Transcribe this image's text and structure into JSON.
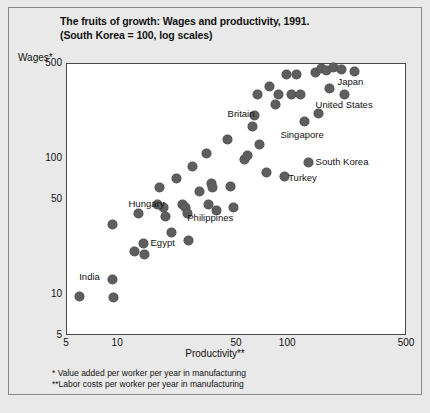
{
  "chart_data": {
    "type": "scatter",
    "title": "The fruits of growth: Wages and productivity, 1991.",
    "subtitle": "(South Korea = 100, log scales)",
    "xlabel": "Productivity**",
    "ylabel": "Wages*",
    "xscale": "log",
    "yscale": "log",
    "xlim": [
      5,
      500
    ],
    "ylim": [
      5,
      500
    ],
    "grid": false,
    "legend": "none",
    "xticks": [
      "5",
      "10",
      "50",
      "100",
      "500"
    ],
    "yticks": [
      "500",
      "100",
      "50",
      "10",
      "5"
    ],
    "footnotes": [
      "* Value added per worker per year in manufacturing",
      "**Labor costs per worker per year in manufacturing"
    ],
    "points": [
      {
        "x": 5.9,
        "y": 9.8
      },
      {
        "x": 9.2,
        "y": 33
      },
      {
        "x": 9.3,
        "y": 13
      },
      {
        "x": 9.4,
        "y": 9.6
      },
      {
        "x": 12.5,
        "y": 21
      },
      {
        "x": 13.2,
        "y": 40
      },
      {
        "x": 14.0,
        "y": 24
      },
      {
        "x": 14.2,
        "y": 20
      },
      {
        "x": 17.0,
        "y": 46
      },
      {
        "x": 17.5,
        "y": 62
      },
      {
        "x": 18.5,
        "y": 44
      },
      {
        "x": 19.0,
        "y": 38
      },
      {
        "x": 20.5,
        "y": 29
      },
      {
        "x": 22.0,
        "y": 72
      },
      {
        "x": 24.0,
        "y": 46
      },
      {
        "x": 25.0,
        "y": 44
      },
      {
        "x": 25.5,
        "y": 40
      },
      {
        "x": 26.0,
        "y": 25
      },
      {
        "x": 27.5,
        "y": 88
      },
      {
        "x": 30.0,
        "y": 58
      },
      {
        "x": 33.0,
        "y": 110
      },
      {
        "x": 34.0,
        "y": 46
      },
      {
        "x": 35.5,
        "y": 66
      },
      {
        "x": 36.0,
        "y": 62
      },
      {
        "x": 38.0,
        "y": 42
      },
      {
        "x": 44.0,
        "y": 140
      },
      {
        "x": 46.0,
        "y": 63
      },
      {
        "x": 48.0,
        "y": 44
      },
      {
        "x": 55.0,
        "y": 100
      },
      {
        "x": 58.0,
        "y": 106
      },
      {
        "x": 62.0,
        "y": 175
      },
      {
        "x": 63.0,
        "y": 210
      },
      {
        "x": 66.0,
        "y": 300
      },
      {
        "x": 68.0,
        "y": 128
      },
      {
        "x": 75.0,
        "y": 80
      },
      {
        "x": 78.0,
        "y": 340
      },
      {
        "x": 84.0,
        "y": 250
      },
      {
        "x": 88.0,
        "y": 300
      },
      {
        "x": 95.0,
        "y": 75
      },
      {
        "x": 98.0,
        "y": 420
      },
      {
        "x": 105.0,
        "y": 300
      },
      {
        "x": 112.0,
        "y": 420
      },
      {
        "x": 118.0,
        "y": 300
      },
      {
        "x": 125.0,
        "y": 190
      },
      {
        "x": 132.0,
        "y": 95
      },
      {
        "x": 145.0,
        "y": 430
      },
      {
        "x": 150.0,
        "y": 215
      },
      {
        "x": 158.0,
        "y": 460
      },
      {
        "x": 168.0,
        "y": 450
      },
      {
        "x": 175.0,
        "y": 330
      },
      {
        "x": 185.0,
        "y": 470
      },
      {
        "x": 205.0,
        "y": 455
      },
      {
        "x": 215.0,
        "y": 300
      },
      {
        "x": 245.0,
        "y": 440
      }
    ],
    "annotations": [
      {
        "label": "India",
        "x": 5.9,
        "y": 13.5,
        "anchor": "left"
      },
      {
        "label": "Egypt",
        "x": 15.5,
        "y": 24,
        "anchor": "left"
      },
      {
        "label": "Hungary",
        "x": 11.5,
        "y": 47,
        "anchor": "left"
      },
      {
        "label": "Philippines",
        "x": 25.5,
        "y": 37,
        "anchor": "left"
      },
      {
        "label": "Turkey",
        "x": 100,
        "y": 72,
        "anchor": "left"
      },
      {
        "label": "South Korea",
        "x": 145,
        "y": 95,
        "anchor": "left"
      },
      {
        "label": "Singapore",
        "x": 90,
        "y": 150,
        "anchor": "left"
      },
      {
        "label": "Britain",
        "x": 44,
        "y": 215,
        "anchor": "left"
      },
      {
        "label": "United States",
        "x": 145,
        "y": 250,
        "anchor": "left"
      },
      {
        "label": "Japan",
        "x": 195,
        "y": 370,
        "anchor": "left"
      }
    ]
  }
}
